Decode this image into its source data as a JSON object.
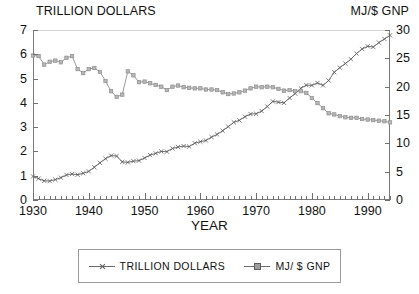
{
  "chart_data": {
    "type": "line",
    "title": "",
    "xlabel": "YEAR",
    "left_axis_title": "TRILLION DOLLARS",
    "right_axis_title": "MJ/$ GNP",
    "xlim": [
      1930,
      1994
    ],
    "xticks": [
      1930,
      1940,
      1950,
      1960,
      1970,
      1980,
      1990
    ],
    "xtick_labels": [
      "1930",
      "1940",
      "1950",
      "1960",
      "1970",
      "1980",
      "1990"
    ],
    "x_minor_tick_step": 1,
    "ylim_left": [
      0,
      7
    ],
    "yticks_left": [
      0,
      1,
      2,
      3,
      4,
      5,
      6,
      7
    ],
    "ytick_labels_left": [
      "0",
      "1",
      "2",
      "3",
      "4",
      "5",
      "6",
      "7"
    ],
    "ylim_right": [
      0,
      30
    ],
    "yticks_right": [
      0,
      5,
      10,
      15,
      20,
      25,
      30
    ],
    "ytick_labels_right": [
      "0",
      "5",
      "10",
      "15",
      "20",
      "25",
      "30"
    ],
    "grid": false,
    "legend_position": "below-center",
    "x": [
      1930,
      1931,
      1932,
      1933,
      1934,
      1935,
      1936,
      1937,
      1938,
      1939,
      1940,
      1941,
      1942,
      1943,
      1944,
      1945,
      1946,
      1947,
      1948,
      1949,
      1950,
      1951,
      1952,
      1953,
      1954,
      1955,
      1956,
      1957,
      1958,
      1959,
      1960,
      1961,
      1962,
      1963,
      1964,
      1965,
      1966,
      1967,
      1968,
      1969,
      1970,
      1971,
      1972,
      1973,
      1974,
      1975,
      1976,
      1977,
      1978,
      1979,
      1980,
      1981,
      1982,
      1983,
      1984,
      1985,
      1986,
      1987,
      1988,
      1989,
      1990,
      1991,
      1992,
      1993,
      1994
    ],
    "series": [
      {
        "name": "TRILLION DOLLARS",
        "axis": "left",
        "units": "trillion dollars",
        "marker": "x",
        "values": [
          0.97,
          0.88,
          0.79,
          0.78,
          0.84,
          0.92,
          1.03,
          1.07,
          1.04,
          1.1,
          1.18,
          1.35,
          1.53,
          1.7,
          1.83,
          1.81,
          1.57,
          1.55,
          1.6,
          1.62,
          1.73,
          1.85,
          1.92,
          2.0,
          1.99,
          2.12,
          2.18,
          2.22,
          2.2,
          2.34,
          2.4,
          2.45,
          2.59,
          2.7,
          2.85,
          3.02,
          3.2,
          3.28,
          3.43,
          3.54,
          3.55,
          3.66,
          3.85,
          4.06,
          4.03,
          4.0,
          4.2,
          4.38,
          4.6,
          4.73,
          4.72,
          4.82,
          4.72,
          4.92,
          5.26,
          5.45,
          5.62,
          5.8,
          6.03,
          6.22,
          6.33,
          6.3,
          6.48,
          6.63,
          6.78
        ]
      },
      {
        "name": "MJ/ $ GNP",
        "axis": "right",
        "units": "MJ per dollar of GNP",
        "marker": "square",
        "values": [
          25.5,
          25.4,
          23.9,
          24.4,
          24.6,
          24.3,
          25.1,
          25.4,
          23.1,
          22.4,
          23.1,
          23.3,
          22.6,
          21.0,
          19.2,
          18.2,
          18.6,
          22.7,
          22.0,
          20.8,
          20.9,
          20.6,
          20.3,
          20.0,
          19.4,
          20.0,
          20.2,
          19.9,
          19.8,
          19.7,
          19.7,
          19.5,
          19.5,
          19.4,
          19.0,
          18.7,
          18.8,
          19.0,
          19.3,
          19.7,
          20.0,
          19.9,
          20.0,
          19.9,
          19.6,
          19.3,
          19.4,
          19.2,
          19.2,
          18.9,
          18.0,
          17.1,
          16.2,
          15.3,
          15.1,
          14.8,
          14.6,
          14.5,
          14.5,
          14.3,
          14.2,
          14.1,
          14.0,
          13.9,
          13.7
        ]
      }
    ]
  },
  "legend": {
    "entries": [
      {
        "label": "TRILLION DOLLARS",
        "marker": "x"
      },
      {
        "label": "MJ/ $ GNP",
        "marker": "square"
      }
    ]
  },
  "colors": {
    "series_1": "#5d5d5d",
    "series_2": "#8f8f8f",
    "axis": "#7b7b7b",
    "text": "#111111",
    "background": "#ffffff"
  },
  "caption": ""
}
